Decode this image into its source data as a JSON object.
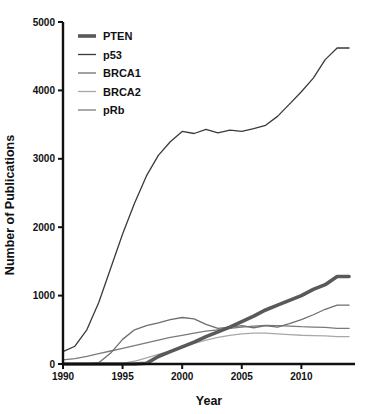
{
  "chart_data": {
    "type": "line",
    "title": "",
    "xlabel": "Year",
    "ylabel": "Number of Publications",
    "xlim": [
      1990,
      2014.5
    ],
    "ylim": [
      0,
      5000
    ],
    "xticks": [
      1990,
      1995,
      2000,
      2005,
      2010
    ],
    "yticks": [
      0,
      1000,
      2000,
      3000,
      4000,
      5000
    ],
    "grid": false,
    "legend_position": "top-left",
    "x": [
      1990,
      1991,
      1992,
      1993,
      1994,
      1995,
      1996,
      1997,
      1998,
      1999,
      2000,
      2001,
      2002,
      2003,
      2004,
      2005,
      2006,
      2007,
      2008,
      2009,
      2010,
      2011,
      2012,
      2013,
      2014
    ],
    "series": [
      {
        "name": "PTEN",
        "color": "#595959",
        "width": 3.6,
        "values": [
          0,
          0,
          0,
          0,
          0,
          0,
          0,
          10,
          110,
          180,
          250,
          320,
          400,
          470,
          540,
          620,
          700,
          790,
          860,
          930,
          1000,
          1090,
          1160,
          1280,
          1280
        ]
      },
      {
        "name": "p53",
        "color": "#3a3a3a",
        "width": 1.3,
        "values": [
          180,
          260,
          500,
          900,
          1400,
          1900,
          2350,
          2750,
          3050,
          3250,
          3400,
          3370,
          3430,
          3380,
          3420,
          3400,
          3440,
          3490,
          3620,
          3800,
          3980,
          4180,
          4450,
          4620,
          4620
        ]
      },
      {
        "name": "BRCA1",
        "color": "#6e6e6e",
        "width": 1.3,
        "values": [
          0,
          0,
          0,
          20,
          160,
          360,
          500,
          560,
          600,
          650,
          680,
          660,
          580,
          520,
          540,
          560,
          530,
          560,
          540,
          590,
          650,
          720,
          800,
          860,
          860
        ]
      },
      {
        "name": "BRCA2",
        "color": "#a8a8a8",
        "width": 1.3,
        "values": [
          0,
          0,
          0,
          0,
          0,
          10,
          40,
          90,
          140,
          190,
          240,
          300,
          350,
          390,
          420,
          440,
          450,
          450,
          440,
          430,
          420,
          415,
          410,
          400,
          400
        ]
      },
      {
        "name": "pRb",
        "color": "#7a7a7a",
        "width": 1.3,
        "values": [
          60,
          80,
          110,
          150,
          190,
          230,
          270,
          310,
          350,
          390,
          420,
          450,
          480,
          500,
          520,
          540,
          555,
          565,
          560,
          555,
          545,
          540,
          535,
          520,
          520
        ]
      }
    ]
  },
  "legend": {
    "items": [
      {
        "label": "PTEN"
      },
      {
        "label": "p53"
      },
      {
        "label": "BRCA1"
      },
      {
        "label": "BRCA2"
      },
      {
        "label": "pRb"
      }
    ]
  },
  "axes": {
    "x_tick_labels": [
      "1990",
      "1995",
      "2000",
      "2005",
      "2010"
    ],
    "y_tick_labels": [
      "0",
      "1000",
      "2000",
      "3000",
      "4000",
      "5000"
    ],
    "x_title": "Year",
    "y_title": "Number of Publications"
  }
}
